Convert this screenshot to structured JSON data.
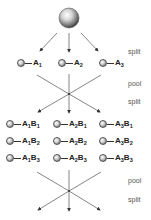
{
  "diagram": {
    "type": "split-and-pool combinatorial synthesis",
    "steps": [
      {
        "label": "split",
        "y": 48
      },
      {
        "label": "pool",
        "y": 80
      },
      {
        "label": "split",
        "y": 98
      },
      {
        "label": "pool",
        "y": 177
      },
      {
        "label": "split",
        "y": 196
      }
    ],
    "round1": [
      {
        "base": "A",
        "sub": "1"
      },
      {
        "base": "A",
        "sub": "2"
      },
      {
        "base": "A",
        "sub": "3"
      }
    ],
    "round2": [
      [
        {
          "a": "1",
          "b": "1"
        },
        {
          "a": "2",
          "b": "1"
        },
        {
          "a": "3",
          "b": "1"
        }
      ],
      [
        {
          "a": "1",
          "b": "2"
        },
        {
          "a": "2",
          "b": "2"
        },
        {
          "a": "3",
          "b": "2"
        }
      ],
      [
        {
          "a": "1",
          "b": "3"
        },
        {
          "a": "2",
          "b": "3"
        },
        {
          "a": "3",
          "b": "3"
        }
      ]
    ],
    "colors": {
      "line": "#666666",
      "text": "#222222",
      "bead_dark": "#444444",
      "bead_light": "#ffffff"
    }
  }
}
